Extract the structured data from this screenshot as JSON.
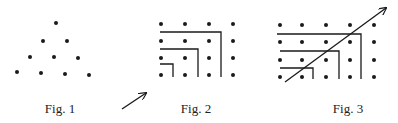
{
  "figures": [
    {
      "id": "fig1",
      "caption": "Fig. 1",
      "caption_pos": [
        60,
        101
      ],
      "description": "triangular arrangement of dots (1+2+3+4)",
      "dots": [
        [
          56,
          23
        ],
        [
          43,
          41
        ],
        [
          67,
          41
        ],
        [
          30,
          57
        ],
        [
          54,
          57
        ],
        [
          78,
          58
        ],
        [
          17,
          72
        ],
        [
          41,
          73
        ],
        [
          65,
          74
        ],
        [
          89,
          75
        ]
      ]
    },
    {
      "id": "fig2",
      "caption": "Fig. 2",
      "caption_pos": [
        196,
        101
      ],
      "description": "4x4 grid of dots with nested L-shaped gnomons",
      "dot_columns": [
        161,
        185,
        209,
        233
      ],
      "dot_rows": [
        24,
        41,
        58,
        75
      ],
      "gnomons": [
        {
          "y": 32,
          "x_start": 160,
          "x_corner": 221,
          "y_end": 77
        },
        {
          "y": 49,
          "x_start": 160,
          "x_corner": 198,
          "y_end": 77
        },
        {
          "y": 64,
          "x_start": 160,
          "x_corner": 173,
          "y_end": 77
        }
      ]
    },
    {
      "id": "fig3",
      "caption": "Fig. 3",
      "caption_pos": [
        348,
        101
      ],
      "description": "4x5 grid of dots with nested L-shaped gnomons and diagonal arrow",
      "dot_columns": [
        280,
        302,
        326,
        350,
        374
      ],
      "dot_rows": [
        25,
        42,
        60,
        77
      ],
      "gnomons": [
        {
          "y": 34,
          "x_start": 277,
          "x_corner": 361,
          "y_end": 79
        },
        {
          "y": 51,
          "x_start": 280,
          "x_corner": 339,
          "y_end": 79
        },
        {
          "y": 68,
          "x_start": 280,
          "x_corner": 313,
          "y_end": 79
        }
      ],
      "diagonal_arrow": {
        "from": [
          285,
          82
        ],
        "to": [
          386,
          8
        ]
      }
    }
  ],
  "standalone_arrow": {
    "from": [
      122,
      109
    ],
    "to": [
      146,
      93
    ]
  },
  "style": {
    "ink": "#1a1a1a",
    "background": "#ffffff"
  }
}
